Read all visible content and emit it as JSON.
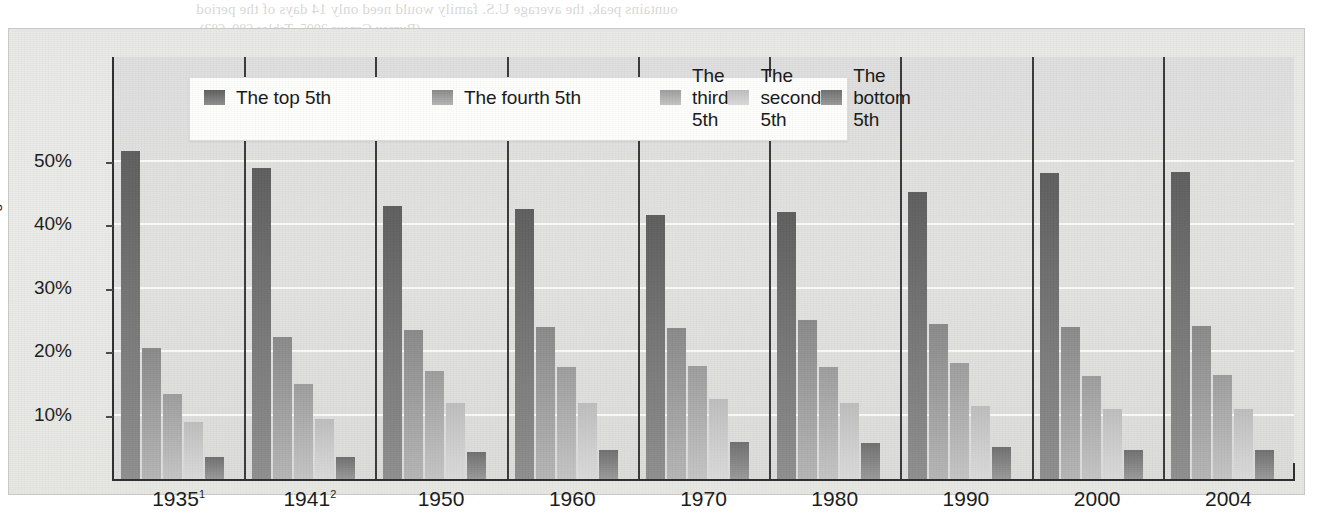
{
  "page": {
    "ghost_text": {
      "top_line_1": "ountains peak, the average U.S. family would need only 14 days of the period",
      "top_line_2": "(Bureau Census 2005, Tables 680, 683).",
      "right_1": "Figure 10.6",
      "right_2": "Unequal Distribution of",
      "right_3": "the Property of",
      "right_4": "Americans",
      "right_5": "Household Net Worth",
      "right_6": "of Assets",
      "center_1": "Unequal Distribution of",
      "center_2": "the Income of Americans",
      "center_3": "Average Families",
      "center_4": "Lowest 20 percent      The Income share",
      "center_5": "Second 20 percent      20.9",
      "center_6": "Middle 20 percent      14.1"
    }
  },
  "chart_data": {
    "type": "bar",
    "title": "",
    "xlabel": "",
    "ylabel": "Percentage",
    "ylim": [
      0,
      55
    ],
    "yticks": [
      10,
      20,
      30,
      40,
      50
    ],
    "ytick_labels": [
      "10%",
      "20%",
      "30%",
      "40%",
      "50%"
    ],
    "grid": true,
    "legend_position": "top-center",
    "categories": [
      "1935",
      "1941",
      "1950",
      "1960",
      "1970",
      "1980",
      "1990",
      "2000",
      "2004"
    ],
    "category_labels": [
      "1935¹",
      "1941²",
      "1950",
      "1960",
      "1970",
      "1980",
      "1990",
      "2000",
      "2004"
    ],
    "category_footnotes": [
      "1",
      "2",
      "",
      "",
      "",
      "",
      "",
      "",
      ""
    ],
    "series": [
      {
        "name": "The top 5th",
        "color_top": "#5e5e5e",
        "color_bottom": "#8f8f8f",
        "values": [
          51.7,
          49.0,
          43.0,
          42.6,
          41.5,
          42.0,
          45.2,
          48.2,
          48.4
        ]
      },
      {
        "name": "The fourth 5th",
        "color_top": "#8a8a8a",
        "color_bottom": "#b5b5b5",
        "values": [
          20.7,
          22.3,
          23.5,
          23.9,
          23.8,
          25.0,
          24.4,
          24.0,
          24.1
        ]
      },
      {
        "name": "The third 5th",
        "color_top": "#9d9d9d",
        "color_bottom": "#c4c4c4",
        "values": [
          13.4,
          15.0,
          17.0,
          17.6,
          17.8,
          17.7,
          18.2,
          16.2,
          16.4
        ]
      },
      {
        "name": "The second 5th",
        "color_top": "#bdbdbd",
        "color_bottom": "#dadada",
        "values": [
          9.0,
          9.5,
          12.0,
          12.0,
          12.6,
          12.0,
          11.5,
          11.0,
          11.0
        ]
      },
      {
        "name": "The bottom 5th",
        "color_top": "#6f6f6f",
        "color_bottom": "#9a9a9a",
        "values": [
          3.4,
          3.5,
          4.2,
          4.6,
          5.9,
          5.7,
          5.0,
          4.6,
          4.6
        ]
      }
    ]
  },
  "legend": {
    "items": [
      {
        "label": "The top 5th"
      },
      {
        "label": "The fourth 5th"
      },
      {
        "label": "The third 5th"
      },
      {
        "label": "The second 5th"
      },
      {
        "label": "The bottom 5th"
      }
    ]
  }
}
